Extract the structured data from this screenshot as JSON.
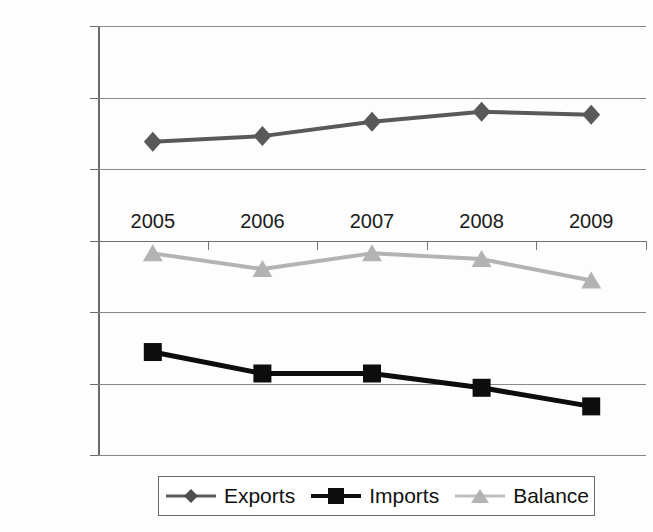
{
  "chart_data": {
    "type": "line",
    "title": "",
    "subtitle": "",
    "xlabel": "",
    "ylabel": "",
    "categories": [
      "2005",
      "2006",
      "2007",
      "2008",
      "2009"
    ],
    "series": [
      {
        "name": "Exports",
        "values": [
          6900,
          7300,
          8300,
          9000,
          8800
        ],
        "color": "#595959",
        "marker": "diamond"
      },
      {
        "name": "Imports",
        "values": [
          -7800,
          -9300,
          -9300,
          -10300,
          -11600
        ],
        "color": "#0d0d0d",
        "marker": "square"
      },
      {
        "name": "Balance",
        "values": [
          -900,
          -2000,
          -900,
          -1300,
          -2800
        ],
        "color": "#b3b3b3",
        "marker": "triangle"
      }
    ],
    "ylim": [
      -15000,
      15000
    ],
    "yticks": [
      15000,
      10000,
      5000,
      0,
      -5000,
      -10000,
      -15000
    ],
    "ytick_labels": [
      "15000",
      "10000",
      "5000",
      "0",
      "−5000",
      "−10000",
      "−15000"
    ],
    "grid": true,
    "grid_axis": "y",
    "legend_position": "bottom",
    "x_axis_label_position": "above-zero-line"
  },
  "legend": {
    "entries": [
      {
        "label": "Exports",
        "icon": "diamond-marker-icon"
      },
      {
        "label": "Imports",
        "icon": "square-marker-icon"
      },
      {
        "label": "Balance",
        "icon": "triangle-marker-icon"
      }
    ]
  }
}
